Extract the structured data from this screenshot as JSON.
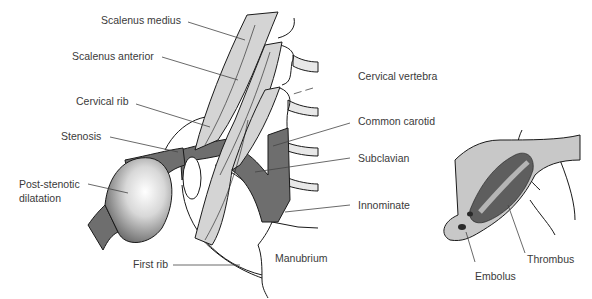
{
  "figure": {
    "left_panel": {
      "labels": {
        "scalenus_medius": "Scalenus medius",
        "scalenus_anterior": "Scalenus anterior",
        "cervical_rib": "Cervical rib",
        "stenosis": "Stenosis",
        "post_stenotic_1": "Post-stenotic",
        "post_stenotic_2": "dilatation",
        "first_rib": "First rib",
        "manubrium": "Manubrium",
        "cervical_vertebra": "Cervical vertebra",
        "common_carotid": "Common carotid",
        "subclavian": "Subclavian",
        "innominate": "Innominate"
      }
    },
    "right_panel": {
      "labels": {
        "embolus": "Embolus",
        "thrombus": "Thrombus"
      }
    },
    "colors": {
      "muscle": "#d4d4d4",
      "vessel": "#6e6e6e",
      "outline": "#1a1a1a",
      "leader": "#444444",
      "lumen": "#c8c8c8"
    }
  }
}
